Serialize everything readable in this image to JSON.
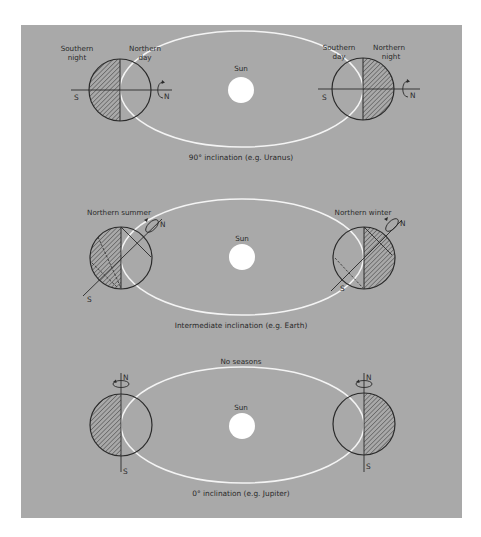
{
  "colors": {
    "page_background": "#ffffff",
    "panel_background": "#a9a9a9",
    "orbit": "#f4f4f4",
    "sun": "#ffffff",
    "ink": "#2a2a2a"
  },
  "panels": [
    {
      "id": "uranus",
      "caption": "90° inclination (e.g. Uranus)",
      "top_label": "",
      "sun_label": "Sun",
      "left_planet": {
        "label_left": "Southern\nnight",
        "label_left_l1": "Southern",
        "label_left_l2": "night",
        "label_right_l1": "Northern",
        "label_right_l2": "day",
        "pole_n": "N",
        "pole_s": "S",
        "night_side": "left"
      },
      "right_planet": {
        "label_left_l1": "Southern",
        "label_left_l2": "day",
        "label_right_l1": "Northern",
        "label_right_l2": "night",
        "pole_n": "N",
        "pole_s": "S",
        "night_side": "right"
      }
    },
    {
      "id": "earth",
      "caption": "Intermediate inclination (e.g. Earth)",
      "top_label": "",
      "sun_label": "Sun",
      "left_planet": {
        "label": "Northern  summer",
        "pole_n": "N",
        "pole_s": "S",
        "night_side": "left"
      },
      "right_planet": {
        "label": "Northern  winter",
        "pole_n": "N",
        "pole_s": "S",
        "night_side": "right"
      }
    },
    {
      "id": "jupiter",
      "caption": "0° inclination (e.g. Jupiter)",
      "top_label": "No seasons",
      "sun_label": "Sun",
      "left_planet": {
        "pole_n": "N",
        "pole_s": "S",
        "night_side": "left"
      },
      "right_planet": {
        "pole_n": "N",
        "pole_s": "S",
        "night_side": "right"
      }
    }
  ]
}
